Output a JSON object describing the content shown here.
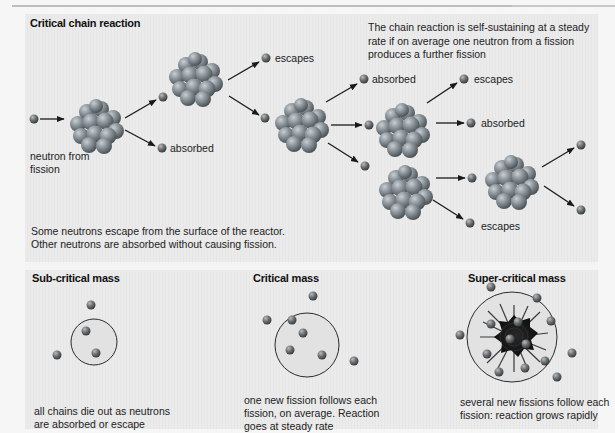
{
  "top_panel": {
    "title": "Critical chain reaction",
    "description": "The chain reaction is self-sustaining at a steady rate if on average one neutron from a fission produces a further fission",
    "footnote_line1": "Some neutrons escape from the surface of the reactor.",
    "footnote_line2": "Other neutrons are absorbed without causing fission.",
    "labels": {
      "neutron_from_fission_line1": "neutron from",
      "neutron_from_fission_line2": "fission",
      "absorbed_1": "absorbed",
      "escapes_1": "escapes",
      "absorbed_2": "absorbed",
      "escapes_2": "escapes",
      "absorbed_3": "absorbed",
      "escapes_3": "escapes"
    }
  },
  "bottom_panel": {
    "columns": [
      {
        "title": "Sub-critical mass",
        "caption_line1": "all chains die out as neutrons",
        "caption_line2": "are absorbed or escape"
      },
      {
        "title": "Critical mass",
        "caption_line1": "one new fission follows each",
        "caption_line2": "fission, on average. Reaction",
        "caption_line3": "goes at steady rate"
      },
      {
        "title": "Super-critical mass",
        "caption_line1": "several new fissions follow each",
        "caption_line2": "fission: reaction grows rapidly"
      }
    ]
  },
  "colors": {
    "panel_background": "#e9e9e9",
    "page_background": "#f6f6f6",
    "nucleon": "#7f8a90",
    "neutron": "#6b6f72",
    "arrow": "#1a1a1a",
    "explosion": "#1c1c1c"
  }
}
